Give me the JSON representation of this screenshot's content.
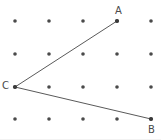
{
  "figure": {
    "width": 161,
    "height": 140,
    "background_color": "#ffffff",
    "dot_color": "#4a4a4a",
    "line_color": "#5a5a5a",
    "label_color": "#4a4a4a",
    "dot_radius": 1.8,
    "line_width": 1
  },
  "grid": {
    "columns": 5,
    "rows": 4,
    "x_start": 15,
    "y_start": 21,
    "x_spacing": 34,
    "y_spacing": 32.7,
    "dots": [
      {
        "x": 15,
        "y": 21
      },
      {
        "x": 49,
        "y": 21
      },
      {
        "x": 83,
        "y": 21
      },
      {
        "x": 117,
        "y": 21
      },
      {
        "x": 151,
        "y": 21
      },
      {
        "x": 15,
        "y": 54
      },
      {
        "x": 49,
        "y": 54
      },
      {
        "x": 83,
        "y": 54
      },
      {
        "x": 117,
        "y": 54
      },
      {
        "x": 151,
        "y": 54
      },
      {
        "x": 15,
        "y": 87
      },
      {
        "x": 49,
        "y": 87
      },
      {
        "x": 83,
        "y": 87
      },
      {
        "x": 117,
        "y": 87
      },
      {
        "x": 151,
        "y": 87
      },
      {
        "x": 15,
        "y": 119
      },
      {
        "x": 49,
        "y": 119
      },
      {
        "x": 83,
        "y": 119
      },
      {
        "x": 117,
        "y": 119
      },
      {
        "x": 151,
        "y": 119
      }
    ]
  },
  "angle": {
    "vertex": "C",
    "points": [
      {
        "name": "A",
        "x": 117,
        "y": 21,
        "label": "A",
        "label_position": "above"
      },
      {
        "name": "B",
        "x": 151,
        "y": 119,
        "label": "B",
        "label_position": "below"
      },
      {
        "name": "C",
        "x": 15,
        "y": 87,
        "label": "C",
        "label_position": "left"
      }
    ],
    "rays": [
      {
        "name": "ray-CA",
        "from": "C",
        "to": "A",
        "path": "M 15 87 L 117 21"
      },
      {
        "name": "ray-CB",
        "from": "C",
        "to": "B",
        "path": "M 15 87 L 151 119"
      }
    ],
    "labels": {
      "A": "A",
      "B": "B",
      "C": "C"
    }
  }
}
